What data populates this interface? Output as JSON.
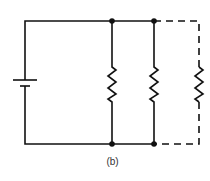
{
  "diagram": {
    "type": "parallel circuit schematic",
    "caption": "(b)",
    "components": [
      {
        "kind": "battery",
        "label": ""
      },
      {
        "kind": "resistor",
        "label": "",
        "style": "solid"
      },
      {
        "kind": "resistor",
        "label": "",
        "style": "solid"
      },
      {
        "kind": "resistor",
        "label": "",
        "style": "dashed"
      }
    ],
    "colors": {
      "line": "#111111",
      "background": "#ffffff"
    }
  }
}
